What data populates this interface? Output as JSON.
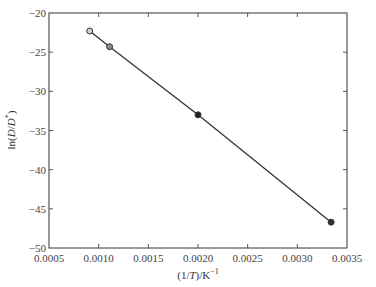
{
  "chart_data": {
    "type": "line",
    "title": "",
    "xlabel": "(1/T)/K⁻¹",
    "xlabel_parts": {
      "prefix": "(1/",
      "italic": "T",
      "suffix": ")/K",
      "sup": "−1"
    },
    "ylabel": "ln(D/D*)",
    "ylabel_parts": {
      "prefix": "ln(",
      "italic1": "D",
      "mid": "/",
      "italic2": "D",
      "sup": "*",
      "suffix": ")"
    },
    "xlim": [
      0.0005,
      0.0035
    ],
    "ylim": [
      -50,
      -20
    ],
    "x_ticks": [
      0.0005,
      0.001,
      0.0015,
      0.002,
      0.0025,
      0.003,
      0.0035
    ],
    "x_tick_labels": [
      "0.0005",
      "0.0010",
      "0.0015",
      "0.0020",
      "0.0025",
      "0.0030",
      "0.0035"
    ],
    "y_ticks": [
      -20,
      -25,
      -30,
      -35,
      -40,
      -45,
      -50
    ],
    "y_tick_labels": [
      "−20",
      "−25",
      "−30",
      "−35",
      "−40",
      "−45",
      "−50"
    ],
    "grid": false,
    "legend": null,
    "series": [
      {
        "name": "ln(D/D*) vs 1/T",
        "x": [
          0.00091,
          0.00111,
          0.002,
          0.00334
        ],
        "y": [
          -22.3,
          -24.3,
          -33.0,
          -46.7
        ],
        "marker_fills": [
          "#cfcfcf",
          "#8a8a8a",
          "#222222",
          "#333333"
        ],
        "line_color": "#333333"
      }
    ]
  }
}
